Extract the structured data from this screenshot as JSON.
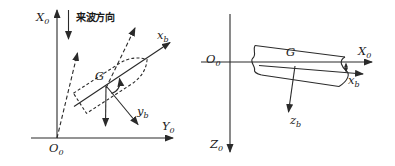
{
  "colors": {
    "background": "#ffffff",
    "line": "#2a2a2a",
    "text": "#1a1a1a"
  },
  "left_diagram": {
    "axis_x0": {
      "main": "X",
      "sub": "0"
    },
    "wave_direction_label": "来波方向",
    "body_axis_xb": {
      "main": "x",
      "sub": "b"
    },
    "center_of_gravity": "G",
    "body_axis_yb": {
      "main": "y",
      "sub": "b"
    },
    "axis_y0": {
      "main": "Y",
      "sub": "0"
    },
    "origin_o0": {
      "main": "O",
      "sub": "0"
    }
  },
  "right_diagram": {
    "origin_o0": {
      "main": "O",
      "sub": "0"
    },
    "axis_x0": {
      "main": "X",
      "sub": "0"
    },
    "body_axis_xb": {
      "main": "x",
      "sub": "b"
    },
    "center_of_gravity": "G",
    "body_axis_zb": {
      "main": "z",
      "sub": "b"
    },
    "axis_z0": {
      "main": "Z",
      "sub": "0"
    }
  }
}
